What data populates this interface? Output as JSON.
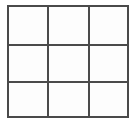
{
  "figure": {
    "name": "3x3-grid",
    "type": "grid",
    "rows": 3,
    "columns": 3,
    "cell_count": 9,
    "background_color": "#ffffff",
    "cell_fill_color": "#fdfdfd",
    "line_color": "#4a4a4a",
    "line_width_px": 2,
    "frame": {
      "left": 7,
      "top": 5,
      "right": 129,
      "bottom": 118,
      "width": 122,
      "height": 113
    },
    "vertical_divider_x": [
      47,
      88
    ],
    "horizontal_divider_y": [
      44,
      81
    ],
    "cells": [
      {
        "id": "cell-r1c1",
        "row": 1,
        "column": 1,
        "label": ""
      },
      {
        "id": "cell-r1c2",
        "row": 1,
        "column": 2,
        "label": ""
      },
      {
        "id": "cell-r1c3",
        "row": 1,
        "column": 3,
        "label": ""
      },
      {
        "id": "cell-r2c1",
        "row": 2,
        "column": 1,
        "label": ""
      },
      {
        "id": "cell-r2c2",
        "row": 2,
        "column": 2,
        "label": ""
      },
      {
        "id": "cell-r2c3",
        "row": 2,
        "column": 3,
        "label": ""
      },
      {
        "id": "cell-r3c1",
        "row": 3,
        "column": 1,
        "label": ""
      },
      {
        "id": "cell-r3c2",
        "row": 3,
        "column": 2,
        "label": ""
      },
      {
        "id": "cell-r3c3",
        "row": 3,
        "column": 3,
        "label": ""
      }
    ]
  }
}
